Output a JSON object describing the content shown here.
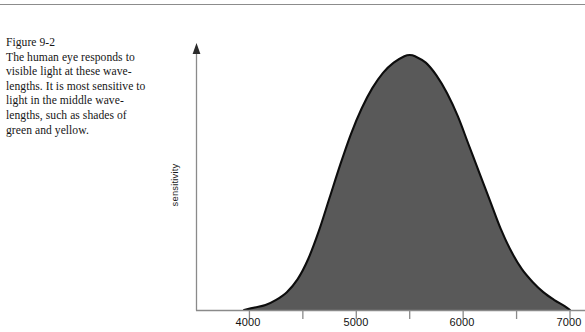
{
  "figure": {
    "label": "Figure 9-2",
    "caption_lines": [
      "The human eye responds to",
      "visible light at these wave-",
      "lengths. It is most sensitive to",
      "light in the middle wave-",
      "lengths, such as shades of",
      "green and yellow."
    ]
  },
  "colors": {
    "curve_fill": "#595959",
    "curve_stroke": "#0d0d0d",
    "axis": "#8a8a8a",
    "text": "#161616",
    "rule": "#8c8c8c"
  },
  "axes": {
    "y_title": "sensitivity",
    "x_tick_labels": [
      "4000",
      "5000",
      "6000",
      "7000"
    ]
  },
  "chart_data": {
    "type": "area",
    "title": "",
    "subtitle": "",
    "xlabel": "",
    "ylabel": "sensitivity",
    "xlim": [
      3500,
      7000
    ],
    "ylim": [
      0,
      1
    ],
    "grid": false,
    "legend": false,
    "x_ticks": [
      4000,
      4500,
      5000,
      5500,
      6000,
      6500,
      7000
    ],
    "x_tick_labels_shown": [
      "4000",
      "",
      "5000",
      "",
      "6000",
      "",
      "7000"
    ],
    "y_ticks": [],
    "y_tick_labels_shown": [],
    "axis_arrow": "y-axis-up",
    "series": [
      {
        "name": "sensitivity",
        "x": [
          3950,
          4050,
          4150,
          4250,
          4350,
          4450,
          4550,
          4650,
          4750,
          4850,
          4950,
          5050,
          5150,
          5250,
          5350,
          5450,
          5500,
          5550,
          5650,
          5750,
          5850,
          5950,
          6050,
          6150,
          6250,
          6350,
          6450,
          6550,
          6650,
          6750,
          6850,
          6950,
          7000
        ],
        "values": [
          0.0,
          0.01,
          0.02,
          0.04,
          0.07,
          0.12,
          0.2,
          0.31,
          0.44,
          0.57,
          0.69,
          0.79,
          0.87,
          0.93,
          0.97,
          0.995,
          1.0,
          0.995,
          0.97,
          0.92,
          0.85,
          0.76,
          0.65,
          0.54,
          0.43,
          0.32,
          0.23,
          0.16,
          0.11,
          0.07,
          0.04,
          0.015,
          0.0
        ]
      }
    ],
    "annotations": []
  }
}
